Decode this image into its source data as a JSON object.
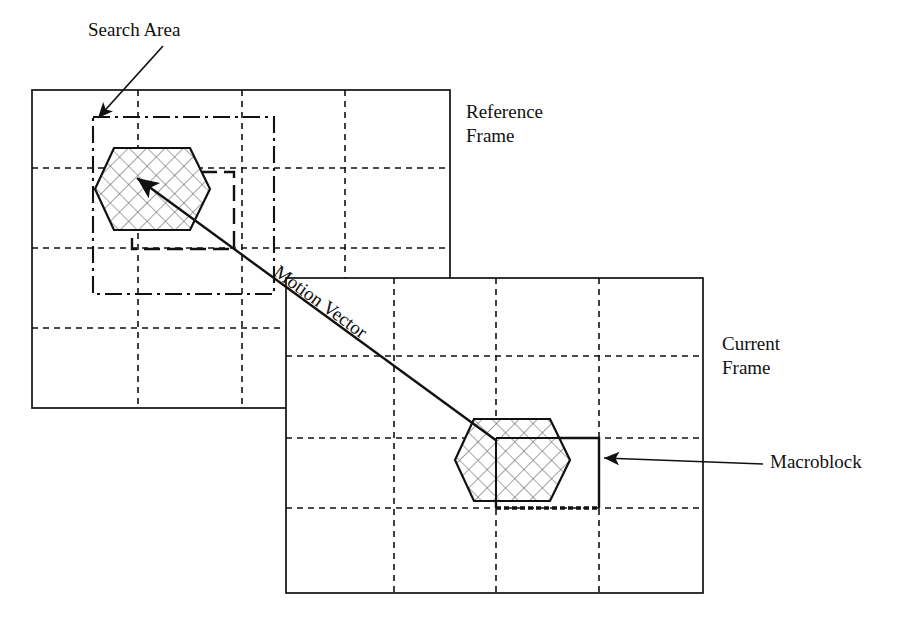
{
  "figure": {
    "title_absent": true,
    "background_color": "#ffffff",
    "line_color": "#111111"
  },
  "labels": {
    "search_area": "Search Area",
    "reference_frame": "Reference\nFrame",
    "current_frame": "Current\nFrame",
    "macroblock": "Macroblock",
    "motion_vector": "Motion Vector"
  },
  "diagram_data": {
    "type": "diagram",
    "description": "Block-based motion estimation: a macroblock in the current frame is matched to a displaced position inside a search area of the reference frame; the offset is the motion vector.",
    "frames": [
      {
        "name": "reference-frame",
        "label": "Reference Frame",
        "rect": {
          "x": 32,
          "y": 90,
          "w": 418,
          "h": 318
        },
        "border": "solid",
        "grid": {
          "style": "dashed",
          "vertical_lines_x": [
            138,
            242,
            345
          ],
          "horizontal_lines_y": [
            168,
            248,
            328
          ],
          "columns": 4,
          "rows": 4
        }
      },
      {
        "name": "current-frame",
        "label": "Current Frame",
        "rect": {
          "x": 286,
          "y": 278,
          "w": 417,
          "h": 315
        },
        "border": "solid",
        "grid": {
          "style": "dashed",
          "vertical_lines_x": [
            394,
            496,
            599
          ],
          "horizontal_lines_y": [
            356,
            438,
            508
          ],
          "columns": 4,
          "rows": 4
        }
      }
    ],
    "search_area_rect": {
      "name": "search-area",
      "x": 93,
      "y": 117,
      "w": 181,
      "h": 177,
      "border": "dash-dot"
    },
    "candidate_block_rect": {
      "name": "matched-block",
      "x": 132,
      "y": 172,
      "w": 102,
      "h": 77,
      "border": "dashed-bold"
    },
    "macroblock_rect": {
      "name": "macroblock",
      "x": 496,
      "y": 438,
      "w": 103,
      "h": 70,
      "border": "bold-solid-dotted-bottom"
    },
    "objects": [
      {
        "name": "reference-hexagon",
        "shape": "hexagon",
        "fill": "cross-hatch",
        "cx": 152,
        "cy": 189,
        "rx": 58,
        "ry": 42
      },
      {
        "name": "current-hexagon",
        "shape": "hexagon",
        "fill": "cross-hatch",
        "cx": 512,
        "cy": 460,
        "rx": 58,
        "ry": 42
      }
    ],
    "arrows": [
      {
        "name": "search-area-pointer",
        "from": {
          "x": 160,
          "y": 48
        },
        "to": {
          "x": 97,
          "y": 120
        }
      },
      {
        "name": "motion-vector-arrow",
        "from": {
          "x": 497,
          "y": 441
        },
        "to": {
          "x": 131,
          "y": 174
        },
        "label": "Motion Vector"
      },
      {
        "name": "macroblock-pointer",
        "from": {
          "x": 762,
          "y": 464
        },
        "to": {
          "x": 601,
          "y": 458
        }
      }
    ]
  }
}
